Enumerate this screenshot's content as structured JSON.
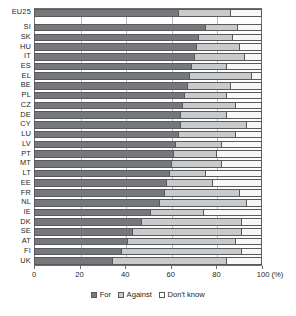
{
  "chart_data": {
    "type": "bar",
    "title": "",
    "subtitle": "",
    "xlabel": "100 (%)",
    "ylabel": "",
    "orientation": "horizontal",
    "stacked": true,
    "stack_total": 100,
    "xlim": [
      0,
      100
    ],
    "xticks": [
      0,
      20,
      40,
      60,
      80,
      100
    ],
    "xticklabels": [
      "0",
      "20",
      "40",
      "60",
      "80",
      "100 (%)"
    ],
    "grid": "vertical",
    "legend_position": "bottom-center",
    "legend": [
      "For",
      "Against",
      "Don't know"
    ],
    "series": [
      {
        "name": "For",
        "color": "#77787b"
      },
      {
        "name": "Against",
        "color": "#c9cacc"
      },
      {
        "name": "Don't know",
        "color": "#f7f7f7"
      }
    ],
    "categories": [
      "EU25",
      "SI",
      "SK",
      "HU",
      "IT",
      "ES",
      "EL",
      "BE",
      "PL",
      "CZ",
      "DE",
      "CY",
      "LU",
      "LV",
      "PT",
      "MT",
      "LT",
      "EE",
      "FR",
      "NL",
      "IE",
      "DK",
      "SE",
      "AT",
      "FI",
      "UK"
    ],
    "rows": [
      {
        "label": "EU25",
        "for": 63,
        "against": 23,
        "dont_know": 14,
        "separated": true
      },
      {
        "label": "SI",
        "for": 75,
        "against": 14,
        "dont_know": 11
      },
      {
        "label": "SK",
        "for": 72,
        "against": 15,
        "dont_know": 13
      },
      {
        "label": "HU",
        "for": 71,
        "against": 19,
        "dont_know": 10
      },
      {
        "label": "IT",
        "for": 70,
        "against": 22,
        "dont_know": 8
      },
      {
        "label": "ES",
        "for": 69,
        "against": 15,
        "dont_know": 16
      },
      {
        "label": "EL",
        "for": 68,
        "against": 27,
        "dont_know": 5
      },
      {
        "label": "BE",
        "for": 67,
        "against": 19,
        "dont_know": 14
      },
      {
        "label": "PL",
        "for": 66,
        "against": 18,
        "dont_know": 16
      },
      {
        "label": "CZ",
        "for": 65,
        "against": 23,
        "dont_know": 12
      },
      {
        "label": "DE",
        "for": 64,
        "against": 20,
        "dont_know": 16
      },
      {
        "label": "CY",
        "for": 64,
        "against": 29,
        "dont_know": 7
      },
      {
        "label": "LU",
        "for": 63,
        "against": 25,
        "dont_know": 12
      },
      {
        "label": "LV",
        "for": 62,
        "against": 20,
        "dont_know": 18
      },
      {
        "label": "PT",
        "for": 61,
        "against": 19,
        "dont_know": 20
      },
      {
        "label": "MT",
        "for": 60,
        "against": 22,
        "dont_know": 18
      },
      {
        "label": "LT",
        "for": 59,
        "against": 16,
        "dont_know": 25
      },
      {
        "label": "EE",
        "for": 58,
        "against": 20,
        "dont_know": 22
      },
      {
        "label": "FR",
        "for": 57,
        "against": 33,
        "dont_know": 10
      },
      {
        "label": "NL",
        "for": 55,
        "against": 38,
        "dont_know": 7
      },
      {
        "label": "IE",
        "for": 51,
        "against": 23,
        "dont_know": 26
      },
      {
        "label": "DK",
        "for": 47,
        "against": 44,
        "dont_know": 9
      },
      {
        "label": "SE",
        "for": 43,
        "against": 48,
        "dont_know": 9
      },
      {
        "label": "AT",
        "for": 41,
        "against": 47,
        "dont_know": 12
      },
      {
        "label": "FI",
        "for": 38,
        "against": 53,
        "dont_know": 9
      },
      {
        "label": "UK",
        "for": 34,
        "against": 50,
        "dont_know": 16
      }
    ]
  }
}
